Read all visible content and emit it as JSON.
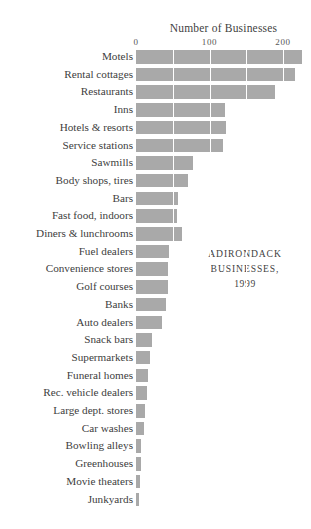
{
  "chart_data": {
    "type": "bar",
    "orientation": "horizontal",
    "title": "Number of Businesses",
    "xlabel": "Number of Businesses",
    "ylabel": "",
    "xlim": [
      0,
      230
    ],
    "grid": true,
    "gridlines_at": [
      0,
      50,
      100,
      150,
      200
    ],
    "tick_labels": [
      "0",
      "100",
      "200"
    ],
    "tick_values": [
      0,
      100,
      200
    ],
    "legend": null,
    "annotation": {
      "line1": "ADIRONDACK",
      "line2": "BUSINESSES,",
      "line3": "1999"
    },
    "bar_color": "#a9a9a9",
    "categories": [
      "Motels",
      "Rental cottages",
      "Restaurants",
      "Inns",
      "Hotels & resorts",
      "Service stations",
      "Sawmills",
      "Body shops, tires",
      "Bars",
      "Fast food, indoors",
      "Diners & lunchrooms",
      "Fuel dealers",
      "Convenience stores",
      "Golf courses",
      "Banks",
      "Auto dealers",
      "Snack bars",
      "Supermarkets",
      "Funeral homes",
      "Rec. vehicle dealers",
      "Large dept. stores",
      "Car washes",
      "Bowling alleys",
      "Greenhouses",
      "Movie theaters",
      "Junkyards"
    ],
    "values": [
      226,
      216,
      189,
      121,
      122,
      118,
      77,
      71,
      57,
      56,
      63,
      45,
      44,
      43,
      41,
      36,
      22,
      19,
      17,
      15,
      12,
      11,
      7,
      7,
      6,
      4
    ]
  }
}
